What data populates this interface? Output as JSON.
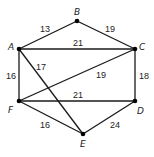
{
  "graph": {
    "nodes": [
      {
        "id": "A",
        "x": 19,
        "y": 49,
        "lx": 8,
        "ly": 50
      },
      {
        "id": "B",
        "x": 77,
        "y": 21,
        "lx": 74,
        "ly": 15
      },
      {
        "id": "C",
        "x": 135,
        "y": 49,
        "lx": 139,
        "ly": 50
      },
      {
        "id": "D",
        "x": 135,
        "y": 101,
        "lx": 137,
        "ly": 114
      },
      {
        "id": "E",
        "x": 83,
        "y": 134,
        "lx": 80,
        "ly": 147
      },
      {
        "id": "F",
        "x": 19,
        "y": 101,
        "lx": 8,
        "ly": 113
      }
    ],
    "edges": [
      {
        "from": "A",
        "to": "B",
        "weight": "13",
        "lx": 40,
        "ly": 32
      },
      {
        "from": "B",
        "to": "C",
        "weight": "19",
        "lx": 105,
        "ly": 32
      },
      {
        "from": "A",
        "to": "C",
        "weight": "21",
        "lx": 73,
        "ly": 46
      },
      {
        "from": "A",
        "to": "F",
        "weight": "16",
        "lx": 6,
        "ly": 79
      },
      {
        "from": "A",
        "to": "E",
        "weight": "17",
        "lx": 36,
        "ly": 70
      },
      {
        "from": "F",
        "to": "C",
        "weight": "19",
        "lx": 96,
        "ly": 78
      },
      {
        "from": "C",
        "to": "D",
        "weight": "18",
        "lx": 139,
        "ly": 79
      },
      {
        "from": "F",
        "to": "D",
        "weight": "21",
        "lx": 73,
        "ly": 98
      },
      {
        "from": "F",
        "to": "E",
        "weight": "16",
        "lx": 40,
        "ly": 128
      },
      {
        "from": "D",
        "to": "E",
        "weight": "24",
        "lx": 110,
        "ly": 128
      }
    ]
  }
}
